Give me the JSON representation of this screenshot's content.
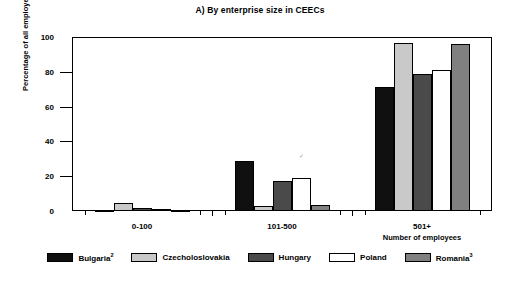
{
  "chart_data": {
    "type": "bar",
    "title": "A) By enterprise size in CEECs",
    "xlabel": "Number of employees",
    "ylabel": "Percentage of all employees",
    "categories": [
      "0-100",
      "101-500",
      "501+"
    ],
    "ylim": [
      0,
      100
    ],
    "yticks": [
      0,
      20,
      40,
      60,
      80,
      100
    ],
    "grid": false,
    "legend_position": "bottom",
    "series": [
      {
        "name": "Bulgaria",
        "footnote": "2",
        "color": "#101010",
        "values": [
          0.3,
          29.0,
          71.0
        ]
      },
      {
        "name": "Czecholoslovakia",
        "footnote": "",
        "color": "#c9c9c9",
        "values": [
          4.5,
          3.0,
          96.5
        ]
      },
      {
        "name": "Hungary",
        "footnote": "",
        "color": "#4a4a4a",
        "values": [
          1.5,
          17.0,
          79.0
        ]
      },
      {
        "name": "Poland",
        "footnote": "",
        "color": "#ffffff",
        "values": [
          1.0,
          19.0,
          81.0
        ]
      },
      {
        "name": "Romania",
        "footnote": "3",
        "color": "#808080",
        "values": [
          0.6,
          3.5,
          96.0
        ]
      }
    ]
  },
  "axis": {
    "y_tick_labels": [
      "0",
      "20",
      "40",
      "60",
      "80",
      "100"
    ],
    "y_title": "Percentage of all employees",
    "x_title": "Number of employees",
    "x_tick_labels": [
      "0-100",
      "101-500",
      "501+"
    ]
  },
  "legend": {
    "items": [
      {
        "label": "Bulgaria",
        "sup": "2"
      },
      {
        "label": "Czecholoslovakia",
        "sup": ""
      },
      {
        "label": "Hungary",
        "sup": ""
      },
      {
        "label": "Poland",
        "sup": ""
      },
      {
        "label": "Romania",
        "sup": "3"
      }
    ]
  }
}
